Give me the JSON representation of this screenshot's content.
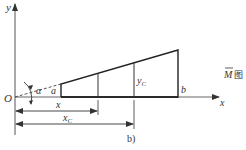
{
  "figure": {
    "caption": "b)",
    "diagram_label": {
      "symbol": "M",
      "suffix": "图"
    },
    "axes": {
      "origin_label": "O",
      "x_axis_label": "x",
      "y_axis_label": "y"
    },
    "points": {
      "a_label": "a",
      "b_label": "b",
      "yc_label": "y",
      "yc_sub": "C"
    },
    "angle_label": "α",
    "dimensions": {
      "x_label": "x",
      "xc_label": "x",
      "xc_sub": "C"
    },
    "colors": {
      "line": "#222222",
      "axis": "#444444"
    }
  }
}
